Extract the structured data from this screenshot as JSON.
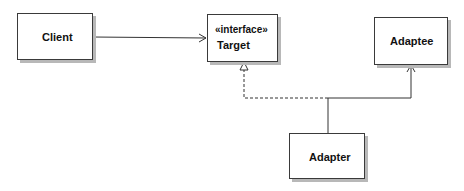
{
  "diagram": {
    "type": "UML class diagram",
    "pattern": "Adapter",
    "classes": [
      {
        "id": "client",
        "name": "Client",
        "stereotype": ""
      },
      {
        "id": "target",
        "name": "Target",
        "stereotype": "«interface»"
      },
      {
        "id": "adaptee",
        "name": "Adaptee",
        "stereotype": ""
      },
      {
        "id": "adapter",
        "name": "Adapter",
        "stereotype": ""
      }
    ],
    "relationships": [
      {
        "from": "Client",
        "to": "Target",
        "kind": "association",
        "style": "solid",
        "head": "open-arrow"
      },
      {
        "from": "Adapter",
        "to": "Target",
        "kind": "realization",
        "style": "dashed",
        "head": "hollow-triangle"
      },
      {
        "from": "Adapter",
        "to": "Adaptee",
        "kind": "association",
        "style": "solid",
        "head": "open-arrow"
      }
    ],
    "colors": {
      "line": "#333333",
      "box_border": "#3a3a3a",
      "shadow": "#b8b8b8",
      "background": "#ffffff"
    }
  }
}
